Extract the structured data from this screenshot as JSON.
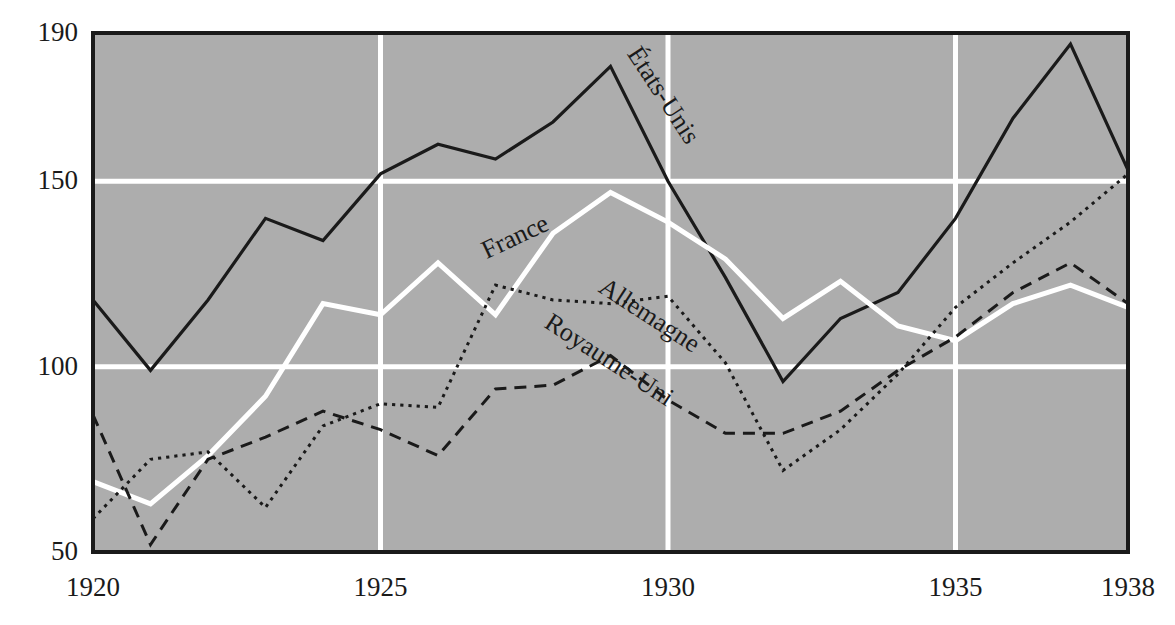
{
  "chart_data": {
    "type": "line",
    "title": "",
    "subtitle": "",
    "xlabel": "",
    "ylabel": "",
    "xlim": [
      1920,
      1938
    ],
    "ylim": [
      50,
      190
    ],
    "grid": true,
    "grid_color": "#ffffff",
    "plot_background": "#adadad",
    "border_color": "#1a1a1a",
    "legend_position": "inline-annotations",
    "x": [
      1920,
      1921,
      1922,
      1923,
      1924,
      1925,
      1926,
      1927,
      1928,
      1929,
      1930,
      1931,
      1932,
      1933,
      1934,
      1935,
      1936,
      1937,
      1938
    ],
    "xticks": [
      1920,
      1925,
      1930,
      1935,
      1938
    ],
    "xticklabels": [
      "1920",
      "1925",
      "1930",
      "1935",
      "1938"
    ],
    "yticks": [
      50,
      100,
      150,
      190
    ],
    "yticklabels": [
      "50",
      "100",
      "150",
      "190"
    ],
    "series": [
      {
        "name": "États-Unis",
        "style": "solid",
        "color": "#1a1a1a",
        "width": 3.2,
        "label_angle": 57,
        "values": [
          118,
          99,
          118,
          140,
          134,
          152,
          160,
          156,
          166,
          181,
          150,
          124,
          96,
          113,
          120,
          140,
          167,
          187,
          153
        ]
      },
      {
        "name": "France",
        "style": "solid",
        "color": "#ffffff",
        "width": 5.0,
        "label_angle": -25,
        "values": [
          69,
          63,
          76,
          92,
          117,
          114,
          128,
          114,
          136,
          147,
          139,
          129,
          113,
          123,
          111,
          107,
          117,
          122,
          116
        ]
      },
      {
        "name": "Allemagne",
        "style": "dotted",
        "color": "#1a1a1a",
        "width": 3.0,
        "label_angle": 33,
        "values": [
          59,
          75,
          77,
          62,
          84,
          90,
          89,
          122,
          118,
          117,
          119,
          101,
          72,
          83,
          98,
          116,
          128,
          139,
          152
        ]
      },
      {
        "name": "Royaume-Uni",
        "style": "dashed",
        "color": "#1a1a1a",
        "width": 3.0,
        "label_angle": 33,
        "values": [
          87,
          52,
          75,
          81,
          88,
          83,
          76,
          94,
          95,
          103,
          91,
          82,
          82,
          88,
          99,
          108,
          120,
          128,
          117
        ]
      }
    ],
    "annotations": [
      {
        "text": "États-Unis",
        "x": 1929.8,
        "y": 172,
        "angle": 57
      },
      {
        "text": "France",
        "x": 1927.4,
        "y": 133,
        "angle": -25
      },
      {
        "text": "Allemagne",
        "x": 1929.6,
        "y": 112,
        "angle": 33
      },
      {
        "text": "Royaume-Uni",
        "x": 1928.9,
        "y": 100,
        "angle": 33
      }
    ]
  }
}
